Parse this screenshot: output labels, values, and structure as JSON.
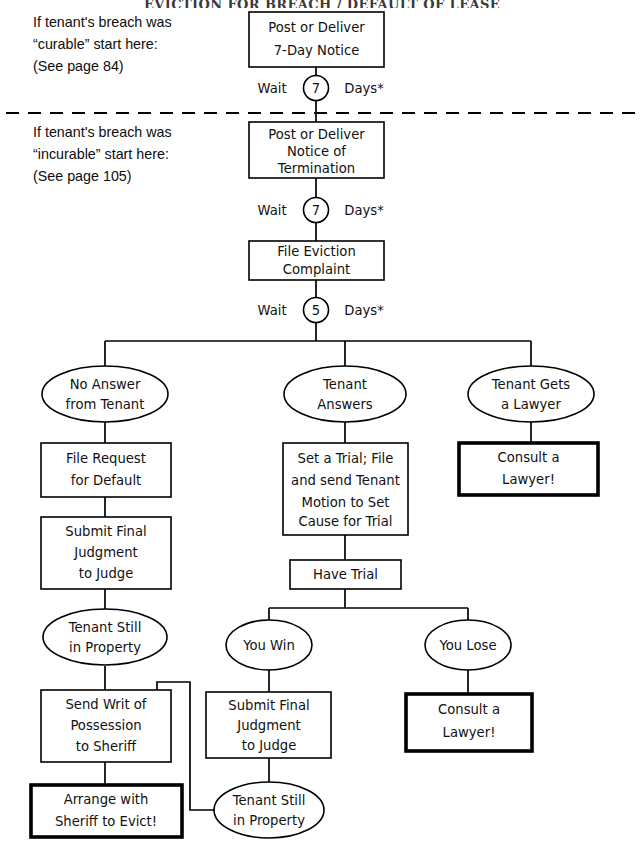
{
  "document": {
    "title": "EVICTION FOR BREACH / DEFAULT OF LEASE",
    "page_width": 644,
    "page_height": 843,
    "background_color": "#ffffff",
    "line_color": "#000000"
  },
  "side_notes": [
    {
      "id": "curable-note",
      "lines": [
        "If tenant's breach was",
        "“curable” start here:",
        "(See page 84)"
      ]
    },
    {
      "id": "incurable-note",
      "lines": [
        "If tenant's breach was",
        "“incurable” start here:",
        "(See page 105)"
      ]
    }
  ],
  "wait_steps": [
    {
      "id": "wait-7-notice",
      "prefix": "Wait",
      "days": "7",
      "suffix": "Days*"
    },
    {
      "id": "wait-7-termination",
      "prefix": "Wait",
      "days": "7",
      "suffix": "Days*"
    },
    {
      "id": "wait-5-complaint",
      "prefix": "Wait",
      "days": "5",
      "suffix": "Days*"
    }
  ],
  "nodes": {
    "post_7_day_notice": {
      "shape": "box",
      "emphasis": false,
      "lines": [
        "Post or Deliver",
        "7-Day Notice"
      ]
    },
    "notice_of_termination": {
      "shape": "box",
      "emphasis": false,
      "lines": [
        "Post or Deliver",
        "Notice of",
        "Termination"
      ]
    },
    "file_eviction_complaint": {
      "shape": "box",
      "emphasis": false,
      "lines": [
        "File Eviction",
        "Complaint"
      ]
    },
    "no_answer_from_tenant": {
      "shape": "ellipse",
      "emphasis": false,
      "lines": [
        "No Answer",
        "from Tenant"
      ]
    },
    "tenant_answers": {
      "shape": "ellipse",
      "emphasis": false,
      "lines": [
        "Tenant",
        "Answers"
      ]
    },
    "tenant_gets_a_lawyer": {
      "shape": "ellipse",
      "emphasis": false,
      "lines": [
        "Tenant Gets",
        "a Lawyer"
      ]
    },
    "file_request_for_default": {
      "shape": "box",
      "emphasis": false,
      "lines": [
        "File Request",
        "for Default"
      ]
    },
    "submit_final_judgment_left": {
      "shape": "box",
      "emphasis": false,
      "lines": [
        "Submit Final",
        "Judgment",
        "to Judge"
      ]
    },
    "tenant_still_in_property_left": {
      "shape": "ellipse",
      "emphasis": false,
      "lines": [
        "Tenant Still",
        "in Property"
      ]
    },
    "send_writ_of_possession": {
      "shape": "box",
      "emphasis": false,
      "lines": [
        "Send Writ of",
        "Possession",
        "to Sheriff"
      ]
    },
    "arrange_with_sheriff": {
      "shape": "box",
      "emphasis": true,
      "lines": [
        "Arrange with",
        "Sheriff to Evict!"
      ]
    },
    "set_a_trial": {
      "shape": "box",
      "emphasis": false,
      "lines": [
        "Set a Trial; File",
        "and send Tenant",
        "Motion to Set",
        "Cause for Trial"
      ]
    },
    "have_trial": {
      "shape": "box",
      "emphasis": false,
      "lines": [
        "Have Trial"
      ]
    },
    "you_win": {
      "shape": "ellipse",
      "emphasis": false,
      "lines": [
        "You Win"
      ]
    },
    "you_lose": {
      "shape": "ellipse",
      "emphasis": false,
      "lines": [
        "You Lose"
      ]
    },
    "submit_final_judgment_center": {
      "shape": "box",
      "emphasis": false,
      "lines": [
        "Submit Final",
        "Judgment",
        "to Judge"
      ]
    },
    "tenant_still_in_property_center": {
      "shape": "ellipse",
      "emphasis": false,
      "lines": [
        "Tenant Still",
        "in Property"
      ]
    },
    "consult_a_lawyer_right": {
      "shape": "box",
      "emphasis": true,
      "lines": [
        "Consult a",
        "Lawyer!"
      ]
    },
    "consult_a_lawyer_lose": {
      "shape": "box",
      "emphasis": true,
      "lines": [
        "Consult a",
        "Lawyer!"
      ]
    }
  }
}
